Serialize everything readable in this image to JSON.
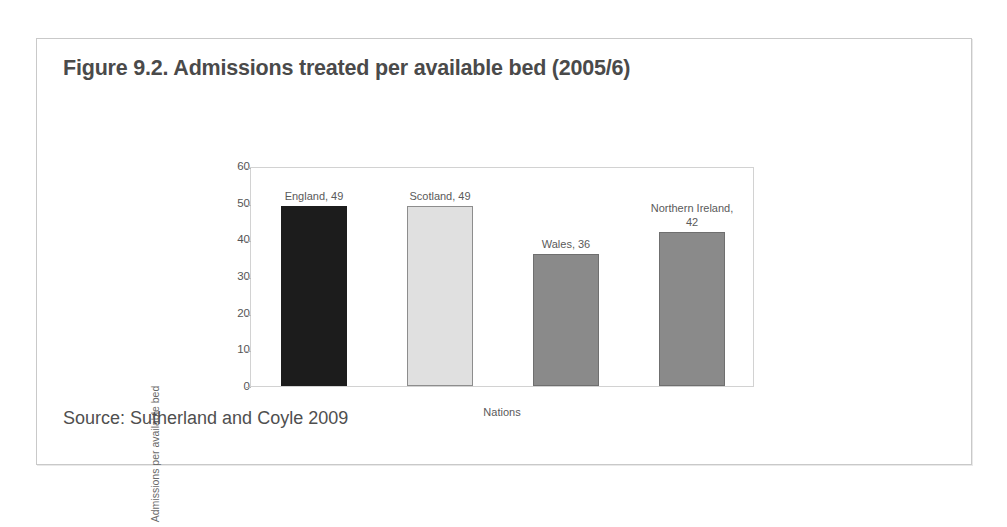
{
  "figure": {
    "title": "Figure 9.2. Admissions treated per available bed (2005/6)",
    "source": "Source: Sutherland and Coyle 2009",
    "border_color": "#c9c9c9",
    "background": "#ffffff",
    "title_color": "#4a4a4a"
  },
  "chart_data": {
    "type": "bar",
    "title": "Figure 9.2. Admissions treated per available bed (2005/6)",
    "xlabel": "Nations",
    "ylabel": "Admissions per available bed",
    "ylim": [
      0,
      60
    ],
    "ytick_step": 10,
    "yticks": [
      60,
      50,
      40,
      30,
      20,
      10,
      0
    ],
    "grid": false,
    "legend": "none",
    "categories": [
      "England",
      "Scotland",
      "Wales",
      "Northern Ireland"
    ],
    "values": [
      49,
      49,
      36,
      42
    ],
    "bar_colors": [
      "#1c1c1c",
      "#e0e0e0",
      "#8a8a8a",
      "#8a8a8a"
    ],
    "bar_border_colors": [
      "#1c1c1c",
      "#8d8d8d",
      "#6f6f6f",
      "#6f6f6f"
    ],
    "data_labels": [
      "England, 49",
      "Scotland, 49",
      "Wales, 36",
      "Northern Ireland,\n42"
    ]
  },
  "axis": {
    "tick_0": "0",
    "tick_10": "10",
    "tick_20": "20",
    "tick_30": "30",
    "tick_40": "40",
    "tick_50": "50",
    "tick_60": "60",
    "y_title": "Admissions per available bed",
    "x_title": "Nations"
  }
}
